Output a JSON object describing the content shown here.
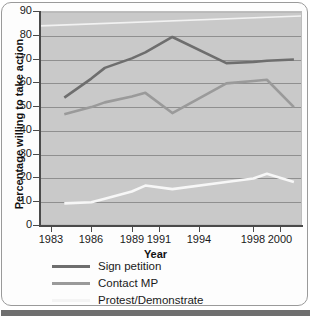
{
  "chart_data": {
    "type": "line",
    "title": "",
    "xlabel": "Year",
    "ylabel": "Percentage willing to take action",
    "x": [
      1984,
      1986,
      1987,
      1989,
      1990,
      1992,
      1996,
      1998,
      1999,
      2001
    ],
    "xtick_labels": [
      "1983",
      "1986",
      "1989",
      "1991",
      "1994",
      "1998",
      "2000"
    ],
    "xtick_values": [
      1983,
      1986,
      1989,
      1991,
      1994,
      1998,
      2000
    ],
    "ytick_labels": [
      "0",
      "10",
      "20",
      "30",
      "40",
      "50",
      "60",
      "70",
      "80",
      "90"
    ],
    "ytick_values": [
      0,
      10,
      20,
      30,
      40,
      50,
      60,
      70,
      80,
      90
    ],
    "ylim": [
      0,
      90
    ],
    "xlim": [
      1982.2,
      2001.6
    ],
    "grid": true,
    "legend_position": "bottom",
    "series": [
      {
        "name": "Sign petition",
        "color": "#6e6e6e",
        "x": [
          1984,
          1986,
          1987,
          1989,
          1990,
          1992,
          1996,
          1998,
          1999,
          2001
        ],
        "values": [
          54,
          62,
          66.5,
          70.5,
          73,
          79.5,
          68.5,
          69,
          69.5,
          70
        ]
      },
      {
        "name": "Contact MP",
        "color": "#9a9a9a",
        "x": [
          1984,
          1986,
          1987,
          1989,
          1990,
          1992,
          1996,
          1998,
          1999,
          2001
        ],
        "values": [
          47,
          50,
          52,
          54.5,
          56,
          47.5,
          60,
          61,
          61.5,
          50
        ]
      },
      {
        "name": "Protest/Demonstrate",
        "color": "#f7f7f7",
        "x": [
          1984,
          1986,
          1987,
          1989,
          1990,
          1992,
          1996,
          1998,
          1999,
          2001
        ],
        "values": [
          9.5,
          10,
          11.5,
          14.5,
          17,
          15.5,
          18.5,
          20,
          22,
          18.5
        ]
      }
    ]
  },
  "axis": {
    "x_title": "Year",
    "y_title": "Percentage willing to take action"
  },
  "legend": {
    "items": [
      {
        "label": "Sign petition",
        "color": "#6e6e6e"
      },
      {
        "label": "Contact MP",
        "color": "#9a9a9a"
      },
      {
        "label": "Protest/Demonstrate",
        "color": "#f4f4f4"
      }
    ]
  },
  "colors": {
    "plot_background": "#c9c9c9",
    "gridline": "#8f8f8f",
    "axis": "#4a4a4a",
    "frame": "#9a9a9a",
    "bottom_bar": "#6f6f6f"
  }
}
